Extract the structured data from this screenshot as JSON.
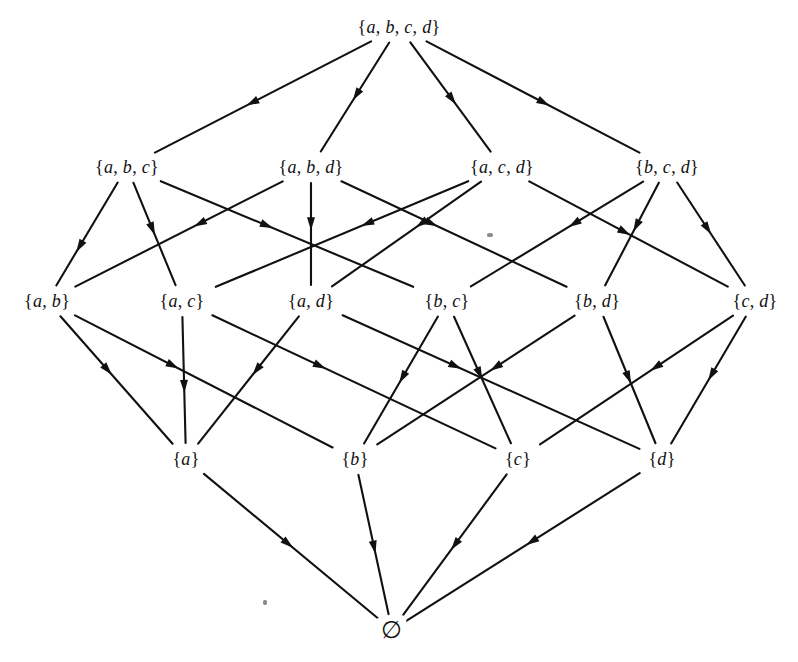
{
  "figure": {
    "background_color": "#ffffff",
    "line_color": "#111111",
    "width": 798,
    "height": 662
  },
  "nodes": [
    {
      "id": "abcd",
      "label": "{a, b, c, d}",
      "x": 399,
      "y": 27,
      "level": 0
    },
    {
      "id": "abc",
      "label": "{a, b, c}",
      "x": 127,
      "y": 167,
      "level": 1
    },
    {
      "id": "abd",
      "label": "{a, b, d}",
      "x": 311,
      "y": 167,
      "level": 1
    },
    {
      "id": "acd",
      "label": "{a, c, d}",
      "x": 502,
      "y": 167,
      "level": 1
    },
    {
      "id": "bcd",
      "label": "{b, c, d}",
      "x": 667,
      "y": 167,
      "level": 1
    },
    {
      "id": "ab",
      "label": "{a, b}",
      "x": 47,
      "y": 301,
      "level": 2
    },
    {
      "id": "ac",
      "label": "{a, c}",
      "x": 182,
      "y": 301,
      "level": 2
    },
    {
      "id": "ad",
      "label": "{a, d}",
      "x": 311,
      "y": 301,
      "level": 2
    },
    {
      "id": "bc",
      "label": "{b, c}",
      "x": 447,
      "y": 301,
      "level": 2
    },
    {
      "id": "bd",
      "label": "{b, d}",
      "x": 597,
      "y": 301,
      "level": 2
    },
    {
      "id": "cd",
      "label": "{c, d}",
      "x": 755,
      "y": 301,
      "level": 2
    },
    {
      "id": "a",
      "label": "{a}",
      "x": 186,
      "y": 459,
      "level": 3
    },
    {
      "id": "b",
      "label": "{b}",
      "x": 355,
      "y": 459,
      "level": 3
    },
    {
      "id": "c",
      "label": "{c}",
      "x": 518,
      "y": 459,
      "level": 3
    },
    {
      "id": "d",
      "label": "{d}",
      "x": 662,
      "y": 459,
      "level": 3
    },
    {
      "id": "empty",
      "label": "∅",
      "x": 392,
      "y": 630,
      "level": 4
    }
  ],
  "edges": [
    {
      "from": "abcd",
      "to": "abc",
      "arrow_t": 0.55
    },
    {
      "from": "abcd",
      "to": "abd",
      "arrow_t": 0.48
    },
    {
      "from": "abcd",
      "to": "acd",
      "arrow_t": 0.52
    },
    {
      "from": "abcd",
      "to": "bcd",
      "arrow_t": 0.55
    },
    {
      "from": "abc",
      "to": "ab",
      "arrow_t": 0.62
    },
    {
      "from": "abc",
      "to": "ac",
      "arrow_t": 0.45
    },
    {
      "from": "abc",
      "to": "bc",
      "arrow_t": 0.42
    },
    {
      "from": "abd",
      "to": "ab",
      "arrow_t": 0.4
    },
    {
      "from": "abd",
      "to": "ad",
      "arrow_t": 0.4
    },
    {
      "from": "abd",
      "to": "bd",
      "arrow_t": 0.4
    },
    {
      "from": "acd",
      "to": "ac",
      "arrow_t": 0.4
    },
    {
      "from": "acd",
      "to": "ad",
      "arrow_t": 0.4
    },
    {
      "from": "acd",
      "to": "cd",
      "arrow_t": 0.48
    },
    {
      "from": "bcd",
      "to": "bc",
      "arrow_t": 0.4
    },
    {
      "from": "bcd",
      "to": "bd",
      "arrow_t": 0.42
    },
    {
      "from": "bcd",
      "to": "cd",
      "arrow_t": 0.45
    },
    {
      "from": "ab",
      "to": "a",
      "arrow_t": 0.42
    },
    {
      "from": "ab",
      "to": "b",
      "arrow_t": 0.38
    },
    {
      "from": "ac",
      "to": "a",
      "arrow_t": 0.55
    },
    {
      "from": "ac",
      "to": "c",
      "arrow_t": 0.38
    },
    {
      "from": "ad",
      "to": "a",
      "arrow_t": 0.42
    },
    {
      "from": "ad",
      "to": "d",
      "arrow_t": 0.38
    },
    {
      "from": "bc",
      "to": "b",
      "arrow_t": 0.48
    },
    {
      "from": "bc",
      "to": "c",
      "arrow_t": 0.45
    },
    {
      "from": "bd",
      "to": "b",
      "arrow_t": 0.4
    },
    {
      "from": "bd",
      "to": "d",
      "arrow_t": 0.48
    },
    {
      "from": "cd",
      "to": "c",
      "arrow_t": 0.4
    },
    {
      "from": "cd",
      "to": "d",
      "arrow_t": 0.46
    },
    {
      "from": "a",
      "to": "empty",
      "arrow_t": 0.48
    },
    {
      "from": "b",
      "to": "empty",
      "arrow_t": 0.52
    },
    {
      "from": "c",
      "to": "empty",
      "arrow_t": 0.5
    },
    {
      "from": "d",
      "to": "empty",
      "arrow_t": 0.46
    }
  ],
  "specks": [
    {
      "x": 487,
      "y": 233,
      "w": 6,
      "h": 4
    },
    {
      "x": 263,
      "y": 600,
      "w": 4,
      "h": 5
    }
  ]
}
